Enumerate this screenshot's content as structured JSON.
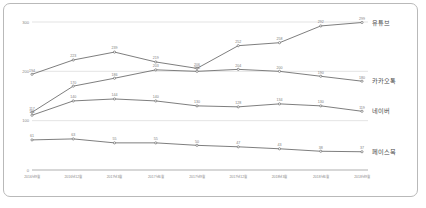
{
  "chart_data": {
    "type": "line",
    "title": "",
    "subtitle": "",
    "xlabel": "",
    "ylabel": "",
    "ylim": [
      0,
      300
    ],
    "yticks": [
      0,
      100,
      200,
      300
    ],
    "grid": true,
    "legend_position": "right-inline",
    "categories": [
      "2016년9월",
      "2016년12월",
      "2017년3월",
      "2017년6월",
      "2017년9월",
      "2017년12월",
      "2018년3월",
      "2018년6월",
      "2018년9월"
    ],
    "series": [
      {
        "name": "유튜브",
        "color": "#6f6f6f",
        "values": [
          194,
          223,
          239,
          219,
          206,
          252,
          258,
          292,
          299
        ]
      },
      {
        "name": "카카오톡",
        "color": "#6f6f6f",
        "values": [
          117,
          170,
          186,
          203,
          200,
          204,
          200,
          190,
          180
        ]
      },
      {
        "name": "네이버",
        "color": "#6f6f6f",
        "values": [
          111,
          140,
          144,
          140,
          130,
          128,
          134,
          130,
          119
        ]
      },
      {
        "name": "페이스북",
        "color": "#6f6f6f",
        "values": [
          61,
          63,
          55,
          55,
          50,
          47,
          43,
          38,
          37
        ]
      }
    ]
  },
  "axis": {
    "y_tick_labels": [
      "0",
      "100",
      "200",
      "300"
    ],
    "x_tick_labels": [
      "2016년9월",
      "2016년12월",
      "2017년3월",
      "2017년6월",
      "2017년9월",
      "2017년12월",
      "2018년3월",
      "2018년6월",
      "2018년9월"
    ]
  },
  "series_labels": [
    "유튜브",
    "카카오톡",
    "네이버",
    "페이스북"
  ],
  "colors": {
    "line": "#6f6f6f",
    "grid": "#d2d2d2",
    "axis": "#8c8c8c",
    "text": "#8a8a8a",
    "series_text": "#4a4a4a",
    "card_border": "#b9b9b9",
    "background": "#ffffff"
  }
}
